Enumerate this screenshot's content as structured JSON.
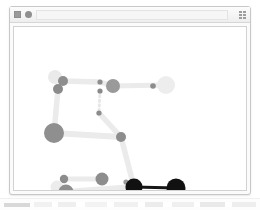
{
  "window": {
    "titlebar": {
      "grid_icon": "grid-icon",
      "dot_icon": "circle-dot-icon",
      "address_value": "",
      "address_placeholder": "",
      "menu_icon": "grid-menu-icon"
    }
  },
  "desktop": {
    "taskbar_label": ""
  },
  "canvas": {
    "background": "#ffffff",
    "border_color": "#d2d2d2"
  },
  "graph_data": {
    "type": "node-link-diagram",
    "title": "",
    "palette": {
      "edge_light": "#ebebeb",
      "edge_mid": "#e2e2e2",
      "edge_dark": "#171717",
      "node_faint": "#ededed",
      "node_light": "#e0e0e0",
      "node_gray": "#8d8d8d",
      "node_mid": "#9a9a9a",
      "node_dark": "#111111"
    },
    "nodes": [
      {
        "id": "n1",
        "x": 41,
        "y": 50,
        "r": 7.0,
        "color": "#eaeaea",
        "label": ""
      },
      {
        "id": "n2",
        "x": 49,
        "y": 54,
        "r": 5.0,
        "color": "#8e8e8e",
        "label": ""
      },
      {
        "id": "n3",
        "x": 44,
        "y": 62,
        "r": 5.0,
        "color": "#8b8b8b",
        "label": ""
      },
      {
        "id": "n4",
        "x": 86,
        "y": 55,
        "r": 2.6,
        "color": "#8e8e8e",
        "label": ""
      },
      {
        "id": "n5",
        "x": 86,
        "y": 64,
        "r": 2.6,
        "color": "#8a8a8a",
        "label": ""
      },
      {
        "id": "n6",
        "x": 99,
        "y": 59,
        "r": 7.0,
        "color": "#9a9a9a",
        "label": ""
      },
      {
        "id": "n7",
        "x": 139,
        "y": 59,
        "r": 2.8,
        "color": "#8d8d8d",
        "label": ""
      },
      {
        "id": "n8",
        "x": 152,
        "y": 58,
        "r": 9.0,
        "color": "#ededed",
        "label": ""
      },
      {
        "id": "n9",
        "x": 85,
        "y": 86,
        "r": 2.6,
        "color": "#8b8b8b",
        "label": ""
      },
      {
        "id": "n10",
        "x": 40,
        "y": 106,
        "r": 10.0,
        "color": "#8f8f8f",
        "label": ""
      },
      {
        "id": "n11",
        "x": 107,
        "y": 110,
        "r": 5.0,
        "color": "#8d8d8d",
        "label": ""
      },
      {
        "id": "n12",
        "x": 50,
        "y": 152,
        "r": 4.2,
        "color": "#8c8c8c",
        "label": ""
      },
      {
        "id": "n13",
        "x": 43,
        "y": 160,
        "r": 6.5,
        "color": "#ececec",
        "label": ""
      },
      {
        "id": "n14",
        "x": 52,
        "y": 165,
        "r": 7.5,
        "color": "#8f8f8f",
        "label": ""
      },
      {
        "id": "n15",
        "x": 88,
        "y": 152,
        "r": 6.5,
        "color": "#8d8d8d",
        "label": ""
      },
      {
        "id": "n16",
        "x": 112,
        "y": 155,
        "r": 2.6,
        "color": "#9a9a9a",
        "label": ""
      },
      {
        "id": "n17",
        "x": 120,
        "y": 160,
        "r": 8.5,
        "color": "#111111",
        "label": ""
      },
      {
        "id": "n18",
        "x": 162,
        "y": 161,
        "r": 9.5,
        "color": "#111111",
        "label": ""
      }
    ],
    "edges": [
      {
        "from": "n2",
        "to": "n4",
        "width": 5.5,
        "color": "#ebebeb"
      },
      {
        "from": "n3",
        "to": "n10",
        "width": 5.5,
        "color": "#ebebeb"
      },
      {
        "from": "n6",
        "to": "n8",
        "width": 5.0,
        "color": "#ebebeb"
      },
      {
        "from": "n4",
        "to": "n6",
        "width": 5.0,
        "color": "#ebebeb"
      },
      {
        "from": "n5",
        "to": "n9",
        "width": 3.0,
        "color": "#e7e7e7",
        "style": "dotted"
      },
      {
        "from": "n9",
        "to": "n11",
        "width": 5.5,
        "color": "#ebebeb"
      },
      {
        "from": "n10",
        "to": "n11",
        "width": 6.0,
        "color": "#ebebeb"
      },
      {
        "from": "n11",
        "to": "n17",
        "width": 5.5,
        "color": "#ebebeb"
      },
      {
        "from": "n12",
        "to": "n15",
        "width": 5.0,
        "color": "#ebebeb"
      },
      {
        "from": "n14",
        "to": "n17",
        "width": 6.0,
        "color": "#ebebeb"
      },
      {
        "from": "n17",
        "to": "n18",
        "width": 3.0,
        "color": "#171717"
      }
    ]
  }
}
